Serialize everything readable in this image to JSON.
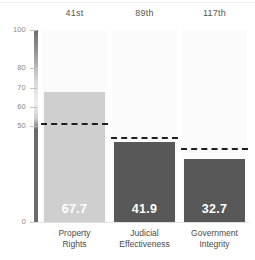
{
  "chart_data": {
    "type": "bar",
    "title": "",
    "subtitle": "",
    "xlabel": "",
    "ylabel": "",
    "ylim": [
      0,
      100
    ],
    "grid": false,
    "legend": "none",
    "categories": [
      "Property Rights",
      "Judicial Effectiveness",
      "Government Integrity"
    ],
    "category_lines": [
      [
        "Property",
        "Rights"
      ],
      [
        "Judicial",
        "Effectiveness"
      ],
      [
        "Government",
        "Integrity"
      ]
    ],
    "values": [
      67.7,
      41.9,
      32.7
    ],
    "value_labels": [
      "67.7",
      "41.9",
      "32.7"
    ],
    "rank_labels": [
      "41st",
      "89th",
      "117th"
    ],
    "reference_lines": [
      51.5,
      44.5,
      38.5
    ],
    "reference_line_style": "dashed",
    "bar_colors": [
      "#cfcfcf",
      "#585858",
      "#585858"
    ],
    "ytick_values": [
      100,
      80,
      70,
      60,
      50,
      0
    ],
    "ytick_labels": [
      "100",
      "80",
      "70",
      "60",
      "50",
      "0"
    ],
    "axis_color": "#6a6a6a",
    "tick_label_color": "#8a8a8a",
    "rank_label_color": "#545454",
    "category_label_color": "#4a4a4a",
    "value_label_color": "#ffffff",
    "background_color": "#ffffff",
    "column_band_color": "#fbfbfb"
  }
}
